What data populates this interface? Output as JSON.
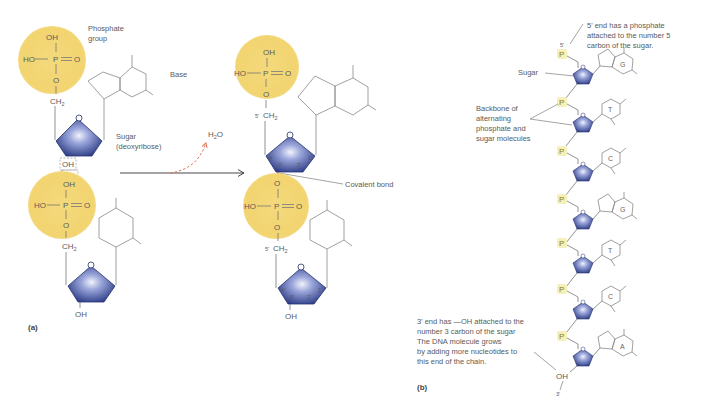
{
  "panel_a": {
    "label": "(a)",
    "nucleotide_top": {
      "phosphate": {
        "oh_top": "OH",
        "ho_left": "HO",
        "p": "P",
        "o_right": "O",
        "o_bottom": "O"
      },
      "ch2": "CH",
      "ch2_sub": "2",
      "ring_o": "O",
      "oh_removed": "OH"
    },
    "nucleotide_bottom": {
      "phosphate": {
        "oh_top": "OH",
        "ho_left": "HO",
        "p": "P",
        "o_right": "O",
        "o_bottom": "O"
      },
      "ch2": "CH",
      "ch2_sub": "2",
      "ring_o": "O",
      "oh": "OH"
    },
    "labels": {
      "phosphate_group_1": "Phosphate",
      "phosphate_group_2": "group",
      "base": "Base",
      "sugar_1": "Sugar",
      "sugar_2": "(deoxyribose)"
    },
    "water": "H",
    "water_sub": "2",
    "water_o": "O"
  },
  "product": {
    "top": {
      "oh_top": "OH",
      "ho_left": "HO",
      "p": "P",
      "o_right": "O",
      "o_bottom": "O",
      "prime": "5'",
      "ch2": "CH",
      "ch2_sub": "2",
      "ring_o": "O"
    },
    "bottom": {
      "o_top": "O",
      "ho_left": "HO",
      "p": "P",
      "o_right": "O",
      "o_bottom": "O",
      "prime": "5'",
      "ch2": "CH",
      "ch2_sub": "2",
      "ring_o": "O",
      "oh": "OH"
    },
    "covalent_bond_label": "Covalent bond",
    "carbon_numbers": [
      "4'",
      "3'",
      "2'",
      "1'"
    ]
  },
  "panel_b": {
    "label": "(b)",
    "five_prime": "5'",
    "three_prime": "3'",
    "terminal_oh": "OH",
    "phosphate_symbol": "P",
    "ring_o": "O",
    "bases": [
      "G",
      "T",
      "C",
      "G",
      "T",
      "C",
      "A"
    ],
    "annotations": {
      "five_end": [
        "5' end has a phosphate",
        "attached to the number 5",
        "carbon of the sugar."
      ],
      "sugar": "Sugar",
      "backbone": [
        "Backbone of",
        "alternating",
        "phosphate and",
        "sugar molecules"
      ],
      "three_end": [
        "3' end has —OH attached to the",
        "number 3 carbon of the sugar",
        "The DNA molecule grows",
        "by adding more nucleotides to",
        "this end of the chain."
      ]
    }
  },
  "colors": {
    "phosphate_fill": "#f2d575",
    "sugar_dark": "#2e3f8a",
    "sugar_light": "#e6e9f7",
    "water_arrow": "#e0725a",
    "covalent_bond": "#d8404a",
    "p_label_bg": "#f5f0b8"
  }
}
